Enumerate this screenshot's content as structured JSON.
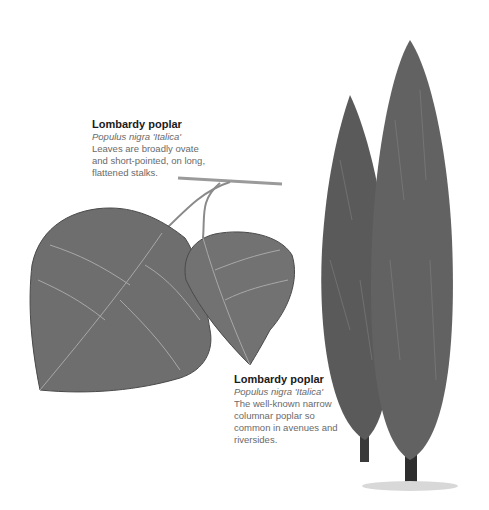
{
  "captions": {
    "leaf": {
      "title": "Lombardy poplar",
      "latin_name": "Populus nigra 'Italica'",
      "lines": [
        "Leaves are broadly ovate",
        "and short-pointed, on long,",
        "flattened stalks."
      ]
    },
    "tree": {
      "title": "Lombardy poplar",
      "latin_name": "Populus nigra 'Italica'",
      "lines": [
        "The well-known narrow",
        "columnar poplar so",
        "common in avenues and",
        "riversides."
      ]
    }
  },
  "illustrations": {
    "leaf": "poplar-leaf-illustration",
    "tree": "lombardy-poplar-tree-illustration"
  },
  "colors": {
    "leaf_fill": "#6e6e6e",
    "tree_fill": "#5a5a5a",
    "title_text": "#1a1a1a",
    "body_text": "#6a6a6a"
  }
}
